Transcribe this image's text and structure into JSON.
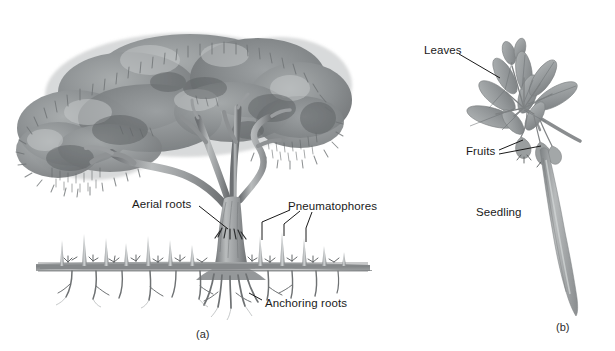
{
  "figure": {
    "background_color": "#ffffff",
    "ink_color": "#1a1a1a"
  },
  "panels": [
    {
      "id": "a",
      "caption": "(a)",
      "subject": "mangrove-tree-whole",
      "labels": [
        {
          "key": "aerial_roots",
          "text": "Aerial roots"
        },
        {
          "key": "pneumatophores",
          "text": "Pneumatophores"
        },
        {
          "key": "anchoring_roots",
          "text": "Anchoring roots"
        }
      ]
    },
    {
      "id": "b",
      "caption": "(b)",
      "subject": "mangrove-propagule-branch",
      "labels": [
        {
          "key": "leaves",
          "text": "Leaves"
        },
        {
          "key": "fruits",
          "text": "Fruits"
        },
        {
          "key": "seedling",
          "text": "Seedling"
        }
      ]
    }
  ],
  "labels": {
    "aerial_roots": "Aerial roots",
    "pneumatophores": "Pneumatophores",
    "anchoring_roots": "Anchoring roots",
    "leaves": "Leaves",
    "fruits": "Fruits",
    "seedling": "Seedling"
  },
  "captions": {
    "panel_a": "(a)",
    "panel_b": "(b)"
  },
  "colors": {
    "foliage_dark": "#6f7375",
    "foliage_mid": "#8d9193",
    "foliage_light": "#b3b7b8",
    "trunk_dark": "#6b6e70",
    "trunk_light": "#c4c7c8",
    "root_gray": "#8a8d8f",
    "leaf_gray": "#9a9e9f",
    "line_black": "#1a1a1a",
    "background": "#ffffff"
  }
}
